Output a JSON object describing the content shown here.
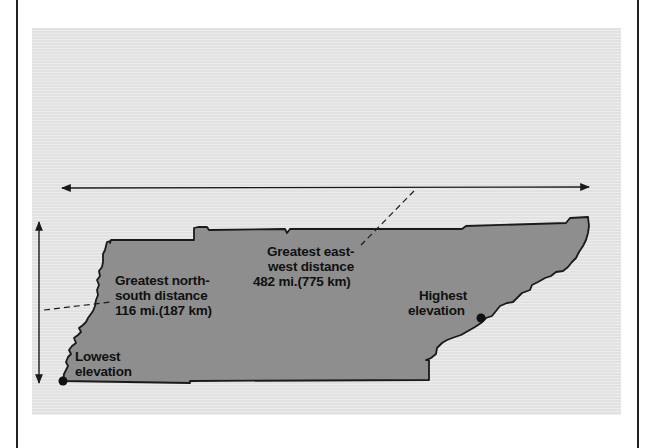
{
  "figure": {
    "colors": {
      "page_background": "#ffffff",
      "panel_background": "#e6e6e6",
      "state_fill": "#8e8e8e",
      "outline": "#1a1a1a",
      "text": "#111111"
    },
    "labels": {
      "north_south": {
        "line1": "Greatest north-",
        "line2": "south distance",
        "line3": "116 mi.(187 km)"
      },
      "east_west": {
        "line1": "Greatest east-",
        "line2": "west distance",
        "line3": "482 mi.(775 km)"
      },
      "highest": {
        "line1": "Highest",
        "line2": "elevation"
      },
      "lowest": {
        "line1": "Lowest",
        "line2": "elevation"
      }
    }
  }
}
